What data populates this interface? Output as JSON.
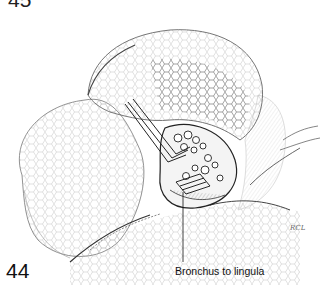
{
  "figure": {
    "previous_figure_number": "45",
    "figure_number": "44",
    "labels": [
      {
        "text": "Bronchus to lingula",
        "points_to": "bronchus-opening"
      }
    ],
    "artist_signature": "RCL"
  },
  "colors": {
    "background": "#ffffff",
    "ink": "#111111",
    "shading": "#555555"
  }
}
